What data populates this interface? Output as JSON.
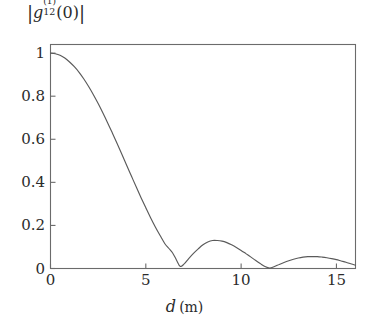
{
  "figure": {
    "background_color": "#ffffff",
    "axis_color": "#6b6b6b",
    "curve_color": "#5a5a5a"
  },
  "labels": {
    "ylabel_bar_left": "|",
    "ylabel_g": "g",
    "ylabel_superscript": "(1)",
    "ylabel_subscript": "12",
    "ylabel_arg": "(0)",
    "ylabel_bar_right": "|",
    "ylabel_full": "|g12^(1)(0)|",
    "xlabel_symbol": "d",
    "xlabel_unit": "(m)",
    "xlabel_full": "d (m)"
  },
  "ticks": {
    "y": [
      "0",
      "0.2",
      "0.4",
      "0.6",
      "0.8",
      "1"
    ],
    "x": [
      "0",
      "5",
      "10",
      "15"
    ]
  },
  "chart_data": {
    "type": "line",
    "title": "",
    "subtitle": "",
    "xlabel": "d (m)",
    "ylabel": "|g12^(1)(0)|",
    "xlim": [
      0,
      16
    ],
    "ylim": [
      0,
      1.04
    ],
    "xticks": [
      0,
      5,
      10,
      15
    ],
    "yticks": [
      0,
      0.2,
      0.4,
      0.6,
      0.8,
      1
    ],
    "grid": false,
    "legend": "none",
    "annotations": [],
    "series": [
      {
        "name": "|g12^(1)(0)|",
        "color": "#5a5a5a",
        "zeros": [
          6.2,
          11.5
        ],
        "lobe_peaks": [
          {
            "x": 0.0,
            "y": 1.0
          },
          {
            "x": 8.5,
            "y": 0.13
          },
          {
            "x": 13.9,
            "y": 0.055
          }
        ],
        "x": [
          0,
          0.25,
          0.5,
          0.75,
          1,
          1.25,
          1.5,
          1.75,
          2,
          2.25,
          2.5,
          2.75,
          3,
          3.25,
          3.5,
          3.75,
          4,
          4.25,
          4.5,
          4.75,
          5,
          5.25,
          5.5,
          5.75,
          6,
          6.2,
          6.4,
          6.6,
          6.8,
          7,
          7.25,
          7.5,
          7.75,
          8,
          8.25,
          8.5,
          8.75,
          9,
          9.25,
          9.5,
          9.75,
          10,
          10.25,
          10.5,
          10.75,
          11,
          11.25,
          11.5,
          11.75,
          12,
          12.25,
          12.5,
          12.75,
          13,
          13.25,
          13.5,
          13.75,
          14,
          14.25,
          14.5,
          14.75,
          15,
          15.25,
          15.5,
          15.75,
          16
        ],
        "y": [
          1.0,
          0.997,
          0.99,
          0.977,
          0.959,
          0.937,
          0.911,
          0.88,
          0.845,
          0.807,
          0.766,
          0.722,
          0.676,
          0.628,
          0.579,
          0.529,
          0.478,
          0.428,
          0.378,
          0.329,
          0.282,
          0.236,
          0.193,
          0.153,
          0.115,
          0.094,
          0.073,
          0.041,
          0.01,
          0.02,
          0.046,
          0.07,
          0.091,
          0.11,
          0.123,
          0.13,
          0.13,
          0.127,
          0.12,
          0.11,
          0.098,
          0.084,
          0.069,
          0.054,
          0.038,
          0.023,
          0.009,
          0.002,
          0.009,
          0.019,
          0.028,
          0.036,
          0.043,
          0.049,
          0.053,
          0.055,
          0.055,
          0.055,
          0.053,
          0.05,
          0.046,
          0.041,
          0.035,
          0.029,
          0.022,
          0.015
        ]
      }
    ]
  }
}
